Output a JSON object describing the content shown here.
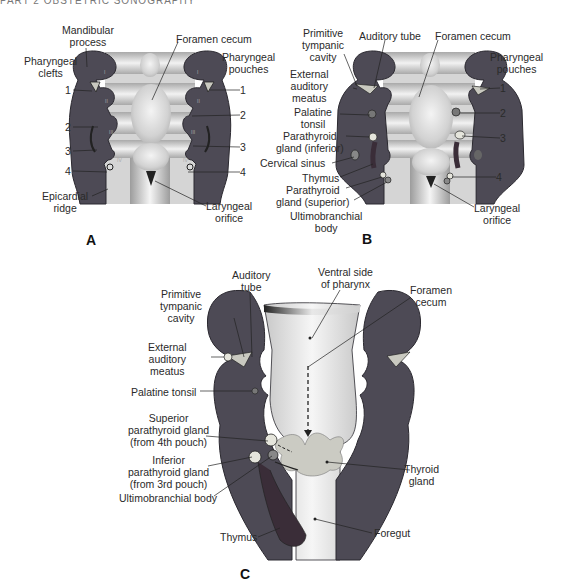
{
  "header": {
    "text": "PART 2   OBSTETRIC SONOGRAPHY"
  },
  "colors": {
    "tissue": "#4d4a55",
    "tissue_outline": "#2b2930",
    "pharynx_light": "#e8e8e8",
    "pharynx_shade": "#b8b8b8",
    "gland": "#d9d9cf",
    "background": "#ffffff"
  },
  "panels": {
    "A": {
      "letter": "A",
      "labels": {
        "mandibular_process": "Mandibular\nprocess",
        "foramen_cecum": "Foramen cecum",
        "pharyngeal_clefts": "Pharyngeal\nclefts",
        "pharyngeal_pouches": "Pharyngeal\npouches",
        "cleft_1": "1",
        "cleft_2": "2",
        "cleft_3": "3",
        "cleft_4": "4",
        "pouch_1": "1",
        "pouch_2": "2",
        "pouch_3": "3",
        "pouch_4": "4",
        "epicardial_ridge": "Epicardial\nridge",
        "laryngeal_orifice": "Laryngeal\norifice"
      },
      "arch_numerals": [
        "I",
        "II",
        "III",
        "IV"
      ]
    },
    "B": {
      "letter": "B",
      "labels": {
        "primitive_tympanic_cavity": "Primitive\ntympanic\ncavity",
        "auditory_tube": "Auditory tube",
        "foramen_cecum": "Foramen cecum",
        "pharyngeal_pouches": "Pharyngeal\npouches",
        "external_auditory_meatus": "External\nauditory\nmeatus",
        "palatine_tonsil": "Palatine\ntonsil",
        "parathyroid_inferior": "Parathyroid\ngland (inferior)",
        "cervical_sinus": "Cervical sinus",
        "thymus": "Thymus",
        "parathyroid_superior": "Parathyroid\ngland (superior)",
        "ultimobranchial_body": "Ultimobranchial\nbody",
        "laryngeal_orifice": "Laryngeal\norifice",
        "pouch_1": "1",
        "pouch_2": "2",
        "pouch_3": "3",
        "pouch_4": "4"
      }
    },
    "C": {
      "letter": "C",
      "labels": {
        "auditory_tube": "Auditory\ntube",
        "ventral_side": "Ventral side\nof pharynx",
        "foramen_cecum": "Foramen\ncecum",
        "primitive_tympanic_cavity": "Primitive\ntympanic\ncavity",
        "external_auditory_meatus": "External\nauditory\nmeatus",
        "palatine_tonsil": "Palatine tonsil",
        "superior_parathyroid": "Superior\nparathyroid gland\n(from 4th pouch)",
        "inferior_parathyroid": "Inferior\nparathyroid gland\n(from 3rd pouch)",
        "ultimobranchial_body": "Ultimobranchial body",
        "thyroid_gland": "Thyroid\ngland",
        "thymus": "Thymus",
        "foregut": "Foregut"
      }
    }
  }
}
